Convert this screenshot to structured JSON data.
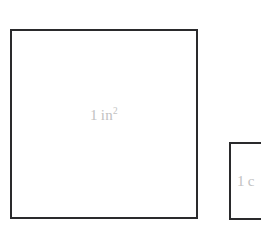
{
  "figure": {
    "type": "geometric-comparison-diagram",
    "background_color": "#ffffff",
    "stroke_color": "#2a2a2c",
    "label_color": "#c2c2c2"
  },
  "shapes": {
    "large_square": {
      "name": "one-square-inch",
      "label_number": "1",
      "label_unit": "in",
      "label_exponent": "2",
      "label_full": "1 in2"
    },
    "small_square": {
      "name": "one-square-centimeter",
      "label_number": "1",
      "label_unit_visible": "c",
      "label_full_visible": "1 c"
    }
  }
}
